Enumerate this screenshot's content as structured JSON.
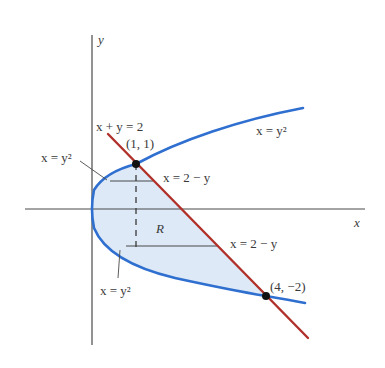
{
  "figure": {
    "axes": {
      "x_label": "x",
      "y_label": "y",
      "axis_color": "#4a4a4a"
    },
    "curves": {
      "parabola": {
        "label_upper": "x = y²",
        "label_left": "x = y²",
        "label_lower": "x = y²",
        "color": "#2f6fd0"
      },
      "line": {
        "label": "x + y = 2",
        "color": "#b0302a"
      }
    },
    "points": [
      {
        "label": "(1, 1)",
        "x": 1,
        "y": 1
      },
      {
        "label": "(4, −2)",
        "x": 4,
        "y": -2
      }
    ],
    "strips": {
      "upper_label": "x = 2 − y",
      "lower_label": "x = 2 − y"
    },
    "region": {
      "label": "R",
      "fill": "#dde9f6"
    }
  }
}
